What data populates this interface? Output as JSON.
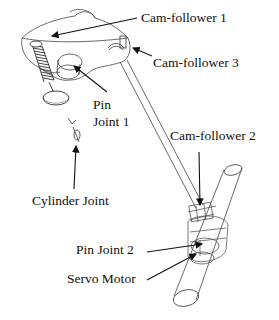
{
  "figure": {
    "type": "mechanism line drawing",
    "labels": {
      "cam_follower_1": "Cam-follower 1",
      "cam_follower_3": "Cam-follower 3",
      "pin_joint_1_line1": "Pin",
      "pin_joint_1_line2": "Joint 1",
      "cam_follower_2": "Cam-follower 2",
      "cylinder_joint": "Cylinder Joint",
      "pin_joint_2": "Pin Joint 2",
      "servo_motor": "Servo Motor"
    },
    "colors": {
      "line": "#333333",
      "arrow": "#111111",
      "background": "#ffffff"
    }
  }
}
